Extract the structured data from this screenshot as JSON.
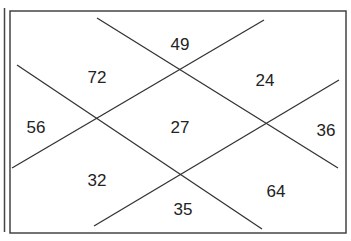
{
  "diagram": {
    "type": "number-puzzle-crossed-lines",
    "colors": {
      "line": "#333333",
      "frame": "#444444",
      "text": "#222222",
      "background": "#ffffff"
    },
    "regions": [
      {
        "id": "top",
        "label": "49",
        "x": 180,
        "y": 44
      },
      {
        "id": "upper-left",
        "label": "72",
        "x": 97,
        "y": 77
      },
      {
        "id": "upper-right",
        "label": "24",
        "x": 265,
        "y": 80
      },
      {
        "id": "left",
        "label": "56",
        "x": 36,
        "y": 127
      },
      {
        "id": "center",
        "label": "27",
        "x": 180,
        "y": 127
      },
      {
        "id": "right",
        "label": "36",
        "x": 326,
        "y": 130
      },
      {
        "id": "lower-left",
        "label": "32",
        "x": 97,
        "y": 180
      },
      {
        "id": "lower-right",
        "label": "64",
        "x": 276,
        "y": 191
      },
      {
        "id": "bottom",
        "label": "35",
        "x": 183,
        "y": 209
      }
    ],
    "lines": [
      {
        "id": "line-a",
        "x1": 97,
        "y1": 18,
        "x2": 338,
        "y2": 168
      },
      {
        "id": "line-b",
        "x1": 264,
        "y1": 20,
        "x2": 12,
        "y2": 168
      },
      {
        "id": "line-c",
        "x1": 17,
        "y1": 65,
        "x2": 262,
        "y2": 229
      },
      {
        "id": "line-d",
        "x1": 339,
        "y1": 80,
        "x2": 94,
        "y2": 226
      }
    ]
  }
}
